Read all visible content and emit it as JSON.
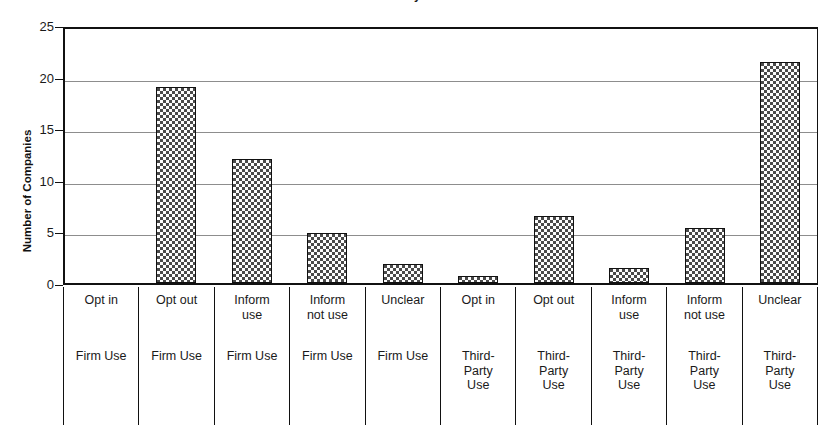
{
  "chart_data": {
    "type": "bar",
    "title": "Privacy Data",
    "xlabel": "",
    "ylabel": "Number of Companies",
    "ylim": [
      0,
      25
    ],
    "yticks": [
      0,
      5,
      10,
      15,
      20,
      25
    ],
    "grid": true,
    "legend": null,
    "categories": [
      "Opt in\nFirm Use",
      "Opt out\nFirm Use",
      "Inform use\nFirm Use",
      "Inform not use\nFirm Use",
      "Unclear\nFirm Use",
      "Opt in\nThird-Party Use",
      "Opt out\nThird-Party Use",
      "Inform use\nThird-Party Use",
      "Inform not use\nThird-Party Use",
      "Unclear\nThird-Party Use"
    ],
    "values": [
      0,
      19,
      12,
      4.8,
      1.8,
      0.7,
      6.5,
      1.5,
      5.3,
      21.4
    ]
  },
  "axis": {
    "y_title": "Number of Companies",
    "tick_labels": [
      "25",
      "20",
      "15",
      "10",
      "5",
      "0"
    ]
  },
  "title": {
    "text": "Privacy Data"
  },
  "category_labels": [
    {
      "policy": "Opt in",
      "use": "Firm Use"
    },
    {
      "policy": "Opt out",
      "use": "Firm Use"
    },
    {
      "policy": "Inform\nuse",
      "use": "Firm Use"
    },
    {
      "policy": "Inform\nnot use",
      "use": "Firm Use"
    },
    {
      "policy": "Unclear",
      "use": "Firm Use"
    },
    {
      "policy": "Opt in",
      "use": "Third-\nParty\nUse"
    },
    {
      "policy": "Opt out",
      "use": "Third-\nParty\nUse"
    },
    {
      "policy": "Inform\nuse",
      "use": "Third-\nParty\nUse"
    },
    {
      "policy": "Inform\nnot use",
      "use": "Third-\nParty\nUse"
    },
    {
      "policy": "Unclear",
      "use": "Third-\nParty\nUse"
    }
  ],
  "colors": {
    "bar_fill": "#4a4a4a",
    "bar_stroke": "#111111",
    "gridline": "#8d8d8d",
    "axis": "#111111",
    "text": "#1a1a1a",
    "background": "#ffffff"
  }
}
